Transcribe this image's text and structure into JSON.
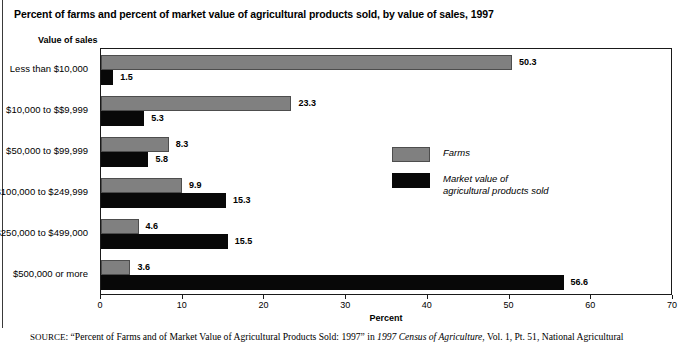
{
  "chart_title": "Percent of farms and percent of market value of agricultural products sold, by value of sales, 1997",
  "axis_header": "Value of sales",
  "legend": {
    "farms_label": "Farms",
    "market_label": "Market value of\nagricultural products sold",
    "farms_color": "#808080",
    "market_color": "#080808"
  },
  "source": {
    "prefix": "SOURCE",
    "colon": ": ",
    "quoted": "“Percent of Farms and of Market Value of Agricultural Products Sold: 1997”",
    "connector": " in ",
    "italic_title": "1997 Census of Agriculture",
    "tail": ", Vol. 1, Pt. 51, National Agricultural"
  },
  "chart_data": {
    "type": "bar",
    "orientation": "horizontal",
    "title": "Percent of farms and percent of market value of agricultural products sold, by value of sales, 1997",
    "xlabel": "Percent",
    "ylabel": "Value of sales",
    "xlim": [
      0,
      70
    ],
    "xticks": [
      0,
      10,
      20,
      30,
      40,
      50,
      60,
      70
    ],
    "xtick_labels": [
      "0",
      "10",
      "20",
      "30",
      "40",
      "50",
      "60",
      "70"
    ],
    "grid": false,
    "legend_position": "inside-center-right",
    "categories": [
      "Less than $10,000",
      "$10,000 to $$9,999",
      "$50,000 to $99,999",
      "$100,000 to $249,999",
      "$250,000 to $499,000",
      "$500,000 or more"
    ],
    "series": [
      {
        "name": "Farms",
        "color": "#808080",
        "values": [
          50.3,
          23.3,
          8.3,
          9.9,
          4.6,
          3.6
        ],
        "value_labels": [
          "50.3",
          "23.3",
          "8.3",
          "9.9",
          "4.6",
          "3.6"
        ]
      },
      {
        "name": "Market value of agricultural products sold",
        "color": "#080808",
        "values": [
          1.5,
          5.3,
          5.8,
          15.3,
          15.5,
          56.6
        ],
        "value_labels": [
          "1.5",
          "5.3",
          "5.8",
          "15.3",
          "15.5",
          "56.6"
        ]
      }
    ]
  }
}
